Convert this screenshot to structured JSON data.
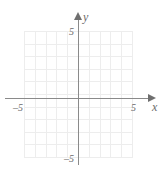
{
  "figure": {
    "type": "cartesian-coordinate-grid",
    "background_color": "#ffffff",
    "grid_color": "#ededed",
    "axis_color": "#8a8a8a",
    "label_color": "#6b6b6b"
  },
  "axes": {
    "x": {
      "name": "x",
      "label": "x",
      "min": -5,
      "max": 5,
      "tick_labels": {
        "negative": "–5",
        "positive": "5"
      },
      "arrow": "right"
    },
    "y": {
      "name": "y",
      "label": "y",
      "min": -5,
      "max": 5,
      "tick_labels": {
        "negative": "–5",
        "positive": "5"
      },
      "arrow": "up"
    }
  },
  "chart_data": {
    "type": "scatter",
    "title": "",
    "xlabel": "x",
    "ylabel": "y",
    "xlim": [
      -5,
      5
    ],
    "ylim": [
      -5,
      5
    ],
    "xticks": [
      -5,
      5
    ],
    "yticks": [
      -5,
      5
    ],
    "xtick_labels": [
      "–5",
      "5"
    ],
    "ytick_labels": [
      "–5",
      "5"
    ],
    "grid": true,
    "grid_spacing": 1,
    "grid_columns": 10,
    "grid_rows": 10,
    "legend": null,
    "series": [],
    "annotations": []
  }
}
